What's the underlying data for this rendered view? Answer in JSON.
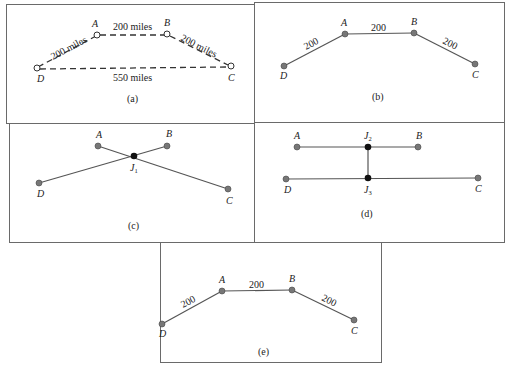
{
  "figure": {
    "panels": [
      {
        "id": "a",
        "caption": "(a)",
        "style": "dashed-open-circles",
        "nodes": {
          "A": "A",
          "B": "B",
          "C": "C",
          "D": "D"
        },
        "edges": {
          "DA": "200 miles",
          "AB": "200 miles",
          "BC": "200 miles",
          "DC": "550 miles"
        }
      },
      {
        "id": "b",
        "caption": "(b)",
        "style": "solid-filled",
        "nodes": {
          "A": "A",
          "B": "B",
          "C": "C",
          "D": "D"
        },
        "edges": {
          "DA": "200",
          "AB": "200",
          "BC": "200"
        }
      },
      {
        "id": "c",
        "caption": "(c)",
        "style": "junction",
        "nodes": {
          "A": "A",
          "B": "B",
          "C": "C",
          "D": "D",
          "J1": "J",
          "J1_sub": "1"
        }
      },
      {
        "id": "d",
        "caption": "(d)",
        "style": "two-junctions",
        "nodes": {
          "A": "A",
          "B": "B",
          "C": "C",
          "D": "D",
          "J2": "J",
          "J2_sub": "2",
          "J3": "J",
          "J3_sub": "3"
        }
      },
      {
        "id": "e",
        "caption": "(e)",
        "style": "solid-filled",
        "nodes": {
          "A": "A",
          "B": "B",
          "C": "C",
          "D": "D"
        },
        "edges": {
          "DA": "200",
          "AB": "200",
          "BC": "200"
        }
      }
    ],
    "colors": {
      "border": "#6a6a6a",
      "line": "#555555",
      "node_fill": "#777777",
      "junction_fill": "#111111"
    }
  }
}
